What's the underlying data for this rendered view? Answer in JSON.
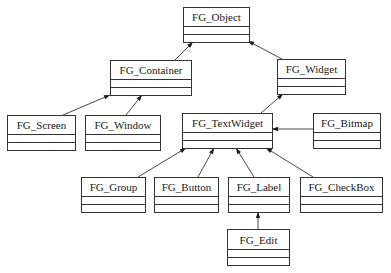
{
  "diagram": {
    "type": "uml-class-hierarchy",
    "classes": [
      {
        "id": "object",
        "name": "FG_Object"
      },
      {
        "id": "container",
        "name": "FG_Container"
      },
      {
        "id": "widget",
        "name": "FG_Widget"
      },
      {
        "id": "screen",
        "name": "FG_Screen"
      },
      {
        "id": "window",
        "name": "FG_Window"
      },
      {
        "id": "textwidget",
        "name": "FG_TextWidget"
      },
      {
        "id": "bitmap",
        "name": "FG_Bitmap"
      },
      {
        "id": "group",
        "name": "FG_Group"
      },
      {
        "id": "button",
        "name": "FG_Button"
      },
      {
        "id": "label",
        "name": "FG_Label"
      },
      {
        "id": "checkbox",
        "name": "FG_CheckBox"
      },
      {
        "id": "edit",
        "name": "FG_Edit"
      }
    ],
    "inheritance": [
      {
        "child": "container",
        "parent": "object"
      },
      {
        "child": "widget",
        "parent": "object"
      },
      {
        "child": "screen",
        "parent": "container"
      },
      {
        "child": "window",
        "parent": "container"
      },
      {
        "child": "textwidget",
        "parent": "widget"
      },
      {
        "child": "bitmap",
        "parent": "textwidget"
      },
      {
        "child": "group",
        "parent": "textwidget"
      },
      {
        "child": "button",
        "parent": "textwidget"
      },
      {
        "child": "label",
        "parent": "textwidget"
      },
      {
        "child": "checkbox",
        "parent": "textwidget"
      },
      {
        "child": "edit",
        "parent": "label"
      }
    ]
  }
}
